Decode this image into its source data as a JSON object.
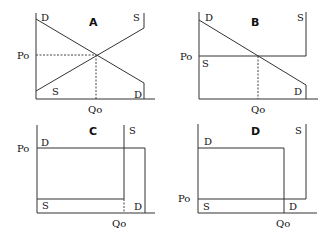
{
  "diagram": {
    "type": "supply-demand-panels",
    "panels": [
      {
        "title": "A",
        "labels": {
          "demand_top": "D",
          "demand_bottom": "D",
          "supply_top": "S",
          "supply_bottom": "S",
          "price": "Po",
          "quantity": "Qo"
        },
        "description": "Downward sloping demand, upward sloping supply, equilibrium at interior point"
      },
      {
        "title": "B",
        "labels": {
          "demand_top": "D",
          "demand_bottom": "D",
          "supply_top": "S",
          "supply_bottom": "S",
          "price": "Po",
          "quantity": "Qo"
        },
        "description": "Downward sloping demand, perfectly elastic (horizontal) supply at Po"
      },
      {
        "title": "C",
        "labels": {
          "demand_top": "D",
          "demand_bottom": "D",
          "supply_top": "S",
          "supply_bottom": "S",
          "price": "Po",
          "quantity": "Qo"
        },
        "description": "Horizontal demand at Po, supply horizontal low then vertical at Qo"
      },
      {
        "title": "D",
        "labels": {
          "demand_top": "D",
          "demand_bottom": "D",
          "supply_top": "S",
          "supply_bottom": "S",
          "price": "Po",
          "quantity": "Qo"
        },
        "description": "Horizontal demand high then vertical at Qo, supply horizontal at Po then vertical"
      }
    ]
  }
}
